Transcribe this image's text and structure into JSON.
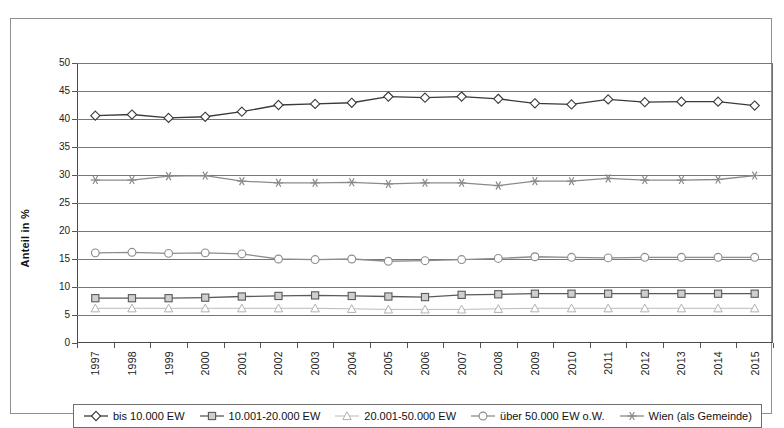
{
  "chart_data": {
    "type": "line",
    "title": "",
    "xlabel": "",
    "ylabel": "Anteil in %",
    "ylim": [
      0,
      50
    ],
    "ytick_step": 5,
    "yticks": [
      "0",
      "5",
      "10",
      "15",
      "20",
      "25",
      "30",
      "35",
      "40",
      "45",
      "50"
    ],
    "grid": true,
    "legend_position": "bottom",
    "categories": [
      "1997",
      "1998",
      "1999",
      "2000",
      "2001",
      "2002",
      "2003",
      "2004",
      "2005",
      "2006",
      "2007",
      "2008",
      "2009",
      "2010",
      "2011",
      "2012",
      "2013",
      "2014",
      "2015"
    ],
    "series": [
      {
        "name": "bis 10.000 EW",
        "marker": "diamond",
        "color": "#3a3a3a",
        "values": [
          40.6,
          40.8,
          40.2,
          40.4,
          41.3,
          42.5,
          42.7,
          42.9,
          44.0,
          43.8,
          44.0,
          43.6,
          42.8,
          42.6,
          43.5,
          43.0,
          43.1,
          43.1,
          42.4
        ]
      },
      {
        "name": "10.001-20.000 EW",
        "marker": "square",
        "color": "#5a5a5a",
        "values": [
          8.0,
          8.0,
          8.0,
          8.1,
          8.3,
          8.4,
          8.5,
          8.4,
          8.3,
          8.2,
          8.6,
          8.7,
          8.8,
          8.8,
          8.8,
          8.8,
          8.8,
          8.8,
          8.8
        ]
      },
      {
        "name": "20.001-50.000 EW",
        "marker": "triangle",
        "color": "#b2b2b2",
        "values": [
          6.2,
          6.2,
          6.2,
          6.2,
          6.2,
          6.2,
          6.2,
          6.1,
          6.0,
          6.0,
          6.0,
          6.1,
          6.2,
          6.2,
          6.2,
          6.2,
          6.2,
          6.2,
          6.2
        ]
      },
      {
        "name": "über 50.000 EW o.W.",
        "marker": "circle",
        "color": "#8c8c8c",
        "values": [
          16.1,
          16.2,
          16.0,
          16.1,
          15.9,
          15.0,
          14.9,
          15.0,
          14.6,
          14.7,
          14.9,
          15.1,
          15.4,
          15.3,
          15.2,
          15.3,
          15.3,
          15.3,
          15.3
        ]
      },
      {
        "name": "Wien (als Gemeinde)",
        "marker": "star",
        "color": "#8a8a8a",
        "values": [
          29.1,
          29.1,
          29.8,
          29.9,
          28.9,
          28.6,
          28.6,
          28.7,
          28.4,
          28.6,
          28.6,
          28.1,
          28.9,
          28.9,
          29.4,
          29.1,
          29.1,
          29.2,
          29.9
        ]
      }
    ]
  }
}
